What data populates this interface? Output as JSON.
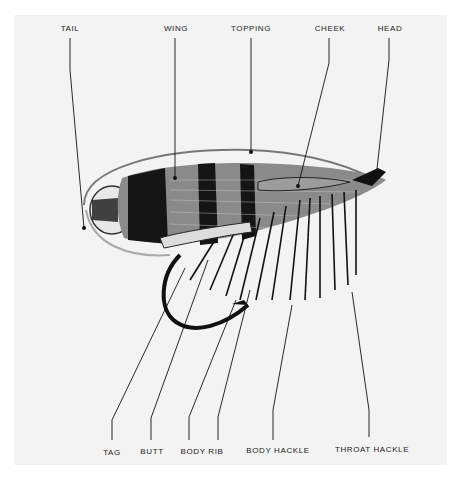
{
  "figure": {
    "top_labels": [
      {
        "text": "TAIL",
        "x": 70,
        "y": 27
      },
      {
        "text": "WING",
        "x": 175,
        "y": 27
      },
      {
        "text": "TOPPING",
        "x": 251,
        "y": 27
      },
      {
        "text": "CHEEK",
        "x": 330,
        "y": 27
      },
      {
        "text": "HEAD",
        "x": 390,
        "y": 27
      }
    ],
    "bottom_labels": [
      {
        "text": "TAG",
        "x": 112,
        "y": 448
      },
      {
        "text": "BUTT",
        "x": 152,
        "y": 448
      },
      {
        "text": "BODY RIB",
        "x": 202,
        "y": 447
      },
      {
        "text": "BODY HACKLE",
        "x": 278,
        "y": 447
      },
      {
        "text": "THROAT HACKLE",
        "x": 372,
        "y": 446
      }
    ],
    "colors": {
      "ink": "#111111",
      "plate": "#f3f3f3",
      "page": "#ffffff"
    }
  }
}
